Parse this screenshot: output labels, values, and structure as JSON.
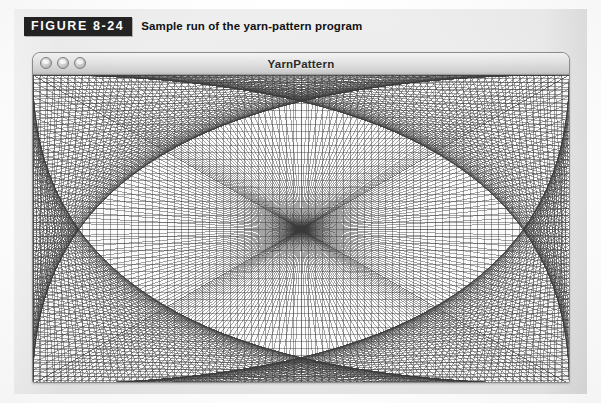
{
  "figure": {
    "tag": "FIGURE 8-24",
    "caption": "Sample run of the yarn-pattern program",
    "tag_bg": "#232323",
    "tag_fg": "#ffffff",
    "panel_bg": "#ebebeb"
  },
  "window": {
    "title": "YarnPattern",
    "controls": [
      {
        "name": "close-button",
        "label": "close"
      },
      {
        "name": "minimize-button",
        "label": "minimize"
      },
      {
        "name": "zoom-button",
        "label": "zoom"
      }
    ],
    "titlebar_bg": "#e3e3e3",
    "canvas_bg": "#fbfbfb"
  },
  "drawing": {
    "name": "yarn-pattern",
    "description": "String-art yarn pattern: straight lines connect evenly spaced points on opposite edges of the rectangle, producing a white diamond envelope at the center.",
    "line_color": "#3a3a3a",
    "line_width": 0.45,
    "points_horizontal": 76,
    "points_vertical": 44,
    "canvas_width": 536,
    "canvas_height": 309,
    "bundles": [
      {
        "name": "top-to-bottom-right",
        "from_edge": "top",
        "to_edge": "bottom",
        "reversed": false
      },
      {
        "name": "top-to-bottom-left",
        "from_edge": "top",
        "to_edge": "bottom",
        "reversed": true
      },
      {
        "name": "left-to-right-down",
        "from_edge": "left",
        "to_edge": "right",
        "reversed": false
      },
      {
        "name": "left-to-right-up",
        "from_edge": "left",
        "to_edge": "right",
        "reversed": true
      }
    ]
  }
}
